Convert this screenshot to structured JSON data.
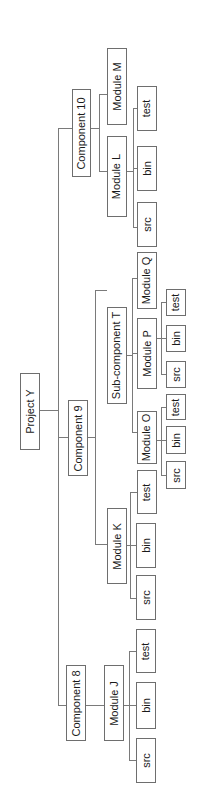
{
  "diagram": {
    "type": "tree",
    "orientation": "rotated-90-ccw",
    "root": "Project Y",
    "nodes": {
      "project_y": "Project Y",
      "component_10": "Component 10",
      "component_9": "Component 9",
      "component_8": "Component 8",
      "module_m": "Module M",
      "module_l": "Module L",
      "module_l_test": "test",
      "module_l_bin": "bin",
      "module_l_src": "src",
      "subcomponent_t": "Sub-component T",
      "module_q": "Module Q",
      "module_p": "Module P",
      "module_p_test": "test",
      "module_p_bin": "bin",
      "module_p_src": "src",
      "module_o": "Module O",
      "module_o_test": "test",
      "module_o_bin": "bin",
      "module_o_src": "src",
      "module_k": "Module K",
      "module_k_test": "test",
      "module_k_bin": "bin",
      "module_k_src": "src",
      "module_j": "Module J",
      "module_j_test": "test",
      "module_j_bin": "bin",
      "module_j_src": "src"
    },
    "hierarchy": {
      "Project Y": {
        "Component 10": {
          "Module M": {},
          "Module L": {
            "test": {},
            "bin": {},
            "src": {}
          }
        },
        "Component 9": {
          "Sub-component T": {
            "Module Q": {},
            "Module P": {
              "test": {},
              "bin": {},
              "src": {}
            },
            "Module O": {
              "test": {},
              "bin": {},
              "src": {}
            }
          },
          "Module K": {
            "test": {},
            "bin": {},
            "src": {}
          }
        },
        "Component 8": {
          "Module J": {
            "test": {},
            "bin": {},
            "src": {}
          }
        }
      }
    },
    "colors": {
      "border": "#6e6e6e",
      "line": "#7a7a7a",
      "text": "#1a1a1a",
      "background": "#ffffff"
    }
  }
}
